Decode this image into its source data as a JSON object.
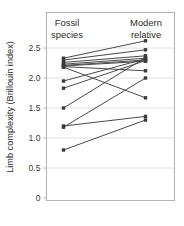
{
  "chart_data": {
    "type": "line",
    "subtype": "slope-chart-paired",
    "title": "",
    "xlabel": "",
    "ylabel": "Limb complexity (Brillouin index)",
    "categories": [
      "Fossil species",
      "Modern relative"
    ],
    "ylim": [
      0,
      2.75
    ],
    "yticks": [
      0,
      0.5,
      1.0,
      1.5,
      2.0,
      2.5
    ],
    "ytick_labels": [
      "0",
      "0.5",
      "1.0",
      "1.5",
      "2.0",
      "2.5"
    ],
    "grid": "horizontal",
    "legend": "none",
    "marker": "square",
    "series": [
      {
        "name": "pair-1",
        "values": [
          2.33,
          2.62
        ]
      },
      {
        "name": "pair-2",
        "values": [
          2.3,
          2.47
        ]
      },
      {
        "name": "pair-3",
        "values": [
          2.26,
          2.37
        ]
      },
      {
        "name": "pair-4",
        "values": [
          2.23,
          2.33
        ]
      },
      {
        "name": "pair-5",
        "values": [
          2.21,
          2.3
        ]
      },
      {
        "name": "pair-6",
        "values": [
          2.2,
          2.28
        ]
      },
      {
        "name": "pair-7",
        "values": [
          2.19,
          2.12
        ]
      },
      {
        "name": "pair-8",
        "values": [
          2.18,
          1.67
        ]
      },
      {
        "name": "pair-9",
        "values": [
          1.95,
          2.32
        ]
      },
      {
        "name": "pair-10",
        "values": [
          1.83,
          2.29
        ]
      },
      {
        "name": "pair-11",
        "values": [
          1.5,
          2.34
        ]
      },
      {
        "name": "pair-12",
        "values": [
          1.2,
          1.36
        ]
      },
      {
        "name": "pair-13",
        "values": [
          1.18,
          2.0
        ]
      },
      {
        "name": "pair-14",
        "values": [
          0.8,
          1.3
        ]
      }
    ],
    "colors": {
      "line": "#4a4a4a",
      "marker": "#3a3a3a",
      "grid": "#e2e2e2",
      "frame": "#b4b4b4",
      "text": "#2b2b2b"
    }
  },
  "axis": {
    "ylabel": "Limb complexity (Brillouin index)"
  },
  "columns": {
    "left": {
      "line1": "Fossil",
      "line2": "species"
    },
    "right": {
      "line1": "Modern",
      "line2": "relative"
    }
  }
}
